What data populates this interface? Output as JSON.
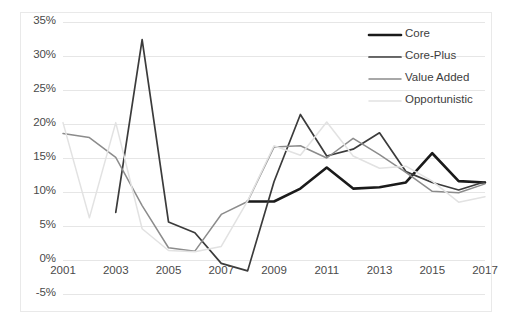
{
  "chart_data": {
    "type": "line",
    "title": "",
    "xlabel": "",
    "ylabel": "",
    "grid": true,
    "legend_position": "top-right",
    "ylim": [
      -5,
      35
    ],
    "ytick_labels": [
      "35%",
      "30%",
      "25%",
      "20%",
      "15%",
      "10%",
      "5%",
      "0%",
      "-5%"
    ],
    "ytick_values": [
      35,
      30,
      25,
      20,
      15,
      10,
      5,
      0,
      -5
    ],
    "xlim": [
      2001,
      2017
    ],
    "xtick_labels": [
      "2001",
      "2003",
      "2005",
      "2007",
      "2009",
      "2011",
      "2013",
      "2015",
      "2017"
    ],
    "xtick_values": [
      2001,
      2003,
      2005,
      2007,
      2009,
      2011,
      2013,
      2015,
      2017
    ],
    "x": [
      2001,
      2002,
      2003,
      2004,
      2005,
      2006,
      2007,
      2008,
      2009,
      2010,
      2011,
      2012,
      2013,
      2014,
      2015,
      2016,
      2017
    ],
    "series": [
      {
        "name": "Core",
        "color": "#1a1a1a",
        "width": 2.6,
        "x": [
          2008,
          2009,
          2010,
          2011,
          2012,
          2013,
          2014,
          2015,
          2016,
          2017
        ],
        "values": [
          8.6,
          8.6,
          10.5,
          13.6,
          10.5,
          10.7,
          11.4,
          15.7,
          11.6,
          11.4
        ]
      },
      {
        "name": "Core-Plus",
        "color": "#3b3b3b",
        "width": 1.7,
        "x": [
          2003,
          2004,
          2005,
          2006,
          2007,
          2008,
          2009,
          2010,
          2011,
          2012,
          2013,
          2014,
          2015,
          2016,
          2017
        ],
        "values": [
          7.0,
          32.4,
          5.6,
          4.0,
          -0.5,
          -1.6,
          11.5,
          21.4,
          15.3,
          16.3,
          18.7,
          13.0,
          11.4,
          10.3,
          11.5
        ]
      },
      {
        "name": "Value Added",
        "color": "#8c8c8c",
        "width": 1.5,
        "x": [
          2001,
          2002,
          2003,
          2004,
          2005,
          2006,
          2007,
          2008,
          2009,
          2010,
          2011,
          2012,
          2013,
          2014,
          2015,
          2016,
          2017
        ],
        "values": [
          18.6,
          18.0,
          15.1,
          8.0,
          1.8,
          1.3,
          6.7,
          8.6,
          16.6,
          16.8,
          15.0,
          17.9,
          15.5,
          12.9,
          10.1,
          9.9,
          11.2
        ]
      },
      {
        "name": "Opportunistic",
        "color": "#e2e2e2",
        "width": 1.5,
        "x": [
          2001,
          2002,
          2003,
          2004,
          2005,
          2006,
          2007,
          2008,
          2009,
          2010,
          2011,
          2012,
          2013,
          2014,
          2015,
          2016,
          2017
        ],
        "values": [
          20.2,
          6.2,
          20.2,
          4.6,
          1.4,
          1.2,
          2.0,
          8.7,
          16.8,
          15.4,
          20.3,
          15.3,
          13.5,
          13.8,
          11.6,
          8.5,
          9.3
        ]
      }
    ]
  },
  "legend": {
    "items": [
      {
        "label": "Core"
      },
      {
        "label": "Core-Plus"
      },
      {
        "label": "Value Added"
      },
      {
        "label": "Opportunistic"
      }
    ]
  }
}
